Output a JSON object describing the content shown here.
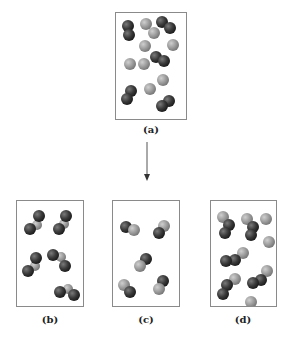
{
  "colors": {
    "dark_atom": "#3a3a3a",
    "light_atom": "#9c9c9c",
    "border": "#8a8a8a",
    "arrow": "#555555"
  },
  "panels": [
    {
      "id": "a",
      "label": "(a)"
    },
    {
      "id": "b",
      "label": "(b)"
    },
    {
      "id": "c",
      "label": "(c)"
    },
    {
      "id": "d",
      "label": "(d)"
    }
  ],
  "arrow": {
    "direction": "down"
  }
}
